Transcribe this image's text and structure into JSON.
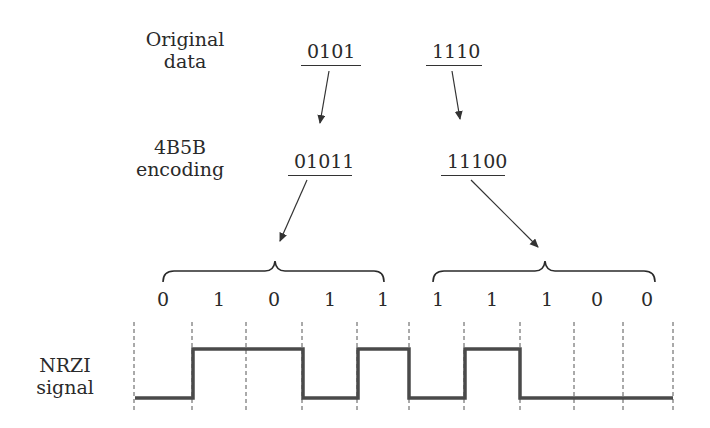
{
  "labels": {
    "original_line1": "Original",
    "original_line2": "data",
    "encoding_line1": "4B5B",
    "encoding_line2": "encoding",
    "signal_line1": "NRZI",
    "signal_line2": "signal"
  },
  "original_data": [
    "0101",
    "1110"
  ],
  "encoded_data": [
    "01011",
    "11100"
  ],
  "bits": [
    "0",
    "1",
    "0",
    "1",
    "1",
    "1",
    "1",
    "1",
    "0",
    "0"
  ],
  "nrzi_levels": [
    "low",
    "high",
    "high",
    "low",
    "high",
    "low",
    "high",
    "low",
    "low",
    "low"
  ],
  "colors": {
    "line": "#4a4a4a",
    "text": "#2a2a2a",
    "dashed": "#555555"
  }
}
